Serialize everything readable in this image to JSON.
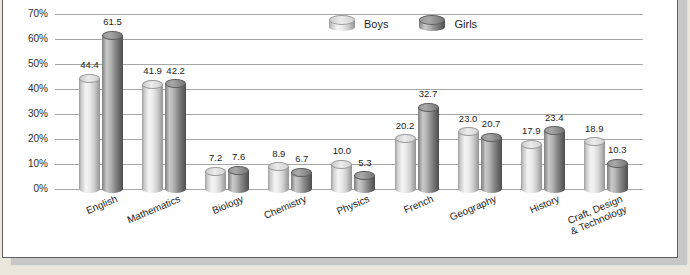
{
  "colors": {
    "page_bg": "#ebe7dd",
    "panel_bg": "#ffffff",
    "panel_border": "#5f5f5f",
    "shadow": "#c7c7c7",
    "gridline": "#a6a6a6",
    "boys_bar": "#ececec",
    "girls_bar": "#8d8d8d",
    "text": "#2e2e2e"
  },
  "chart_data": {
    "type": "bar",
    "title": "",
    "subtitle": "",
    "xlabel": "",
    "ylabel": "",
    "ylim": [
      0,
      70
    ],
    "grid": true,
    "bar_style": "3d-cylinder",
    "legend_position": "top-center",
    "y_ticks": [
      "0%",
      "10%",
      "20%",
      "30%",
      "40%",
      "50%",
      "60%",
      "70%"
    ],
    "categories": [
      "English",
      "Mathematics",
      "Biology",
      "Chemistry",
      "Physics",
      "French",
      "Geography",
      "History",
      "Craft, Design\n& Technology"
    ],
    "series": [
      {
        "name": "Boys",
        "values": [
          44.4,
          41.9,
          7.2,
          8.9,
          10.0,
          20.2,
          23.0,
          17.9,
          18.9
        ],
        "labels": [
          "44.4",
          "41.9",
          "7.2",
          "8.9",
          "10.0",
          "20.2",
          "23.0",
          "17.9",
          "18.9"
        ]
      },
      {
        "name": "Girls",
        "values": [
          61.5,
          42.2,
          7.6,
          6.7,
          5.3,
          32.7,
          20.7,
          23.4,
          10.3
        ],
        "labels": [
          "61.5",
          "42.2",
          "7.6",
          "6.7",
          "5.3",
          "32.7",
          "20.7",
          "23.4",
          "10.3"
        ]
      }
    ]
  }
}
